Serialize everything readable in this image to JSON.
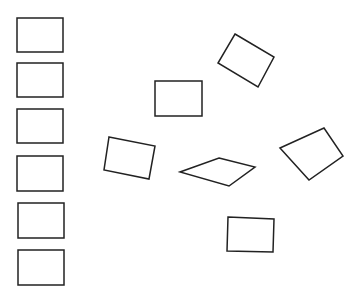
{
  "canvas": {
    "width": 358,
    "height": 299,
    "background": "#ffffff",
    "stroke": "#222222",
    "stroke_width": 1.5
  },
  "shapes": [
    {
      "id": "left-rect-1",
      "points": "17,18 63,18 63,52 17,52"
    },
    {
      "id": "left-rect-2",
      "points": "17,63 63,63 63,97 17,97"
    },
    {
      "id": "left-rect-3",
      "points": "17,109 63,109 63,143 17,143"
    },
    {
      "id": "left-rect-4",
      "points": "17,156 63,156 63,191 17,191"
    },
    {
      "id": "left-rect-5",
      "points": "18,203 64,203 64,238 18,238"
    },
    {
      "id": "left-rect-6",
      "points": "18,250 64,250 64,285 18,285"
    },
    {
      "id": "rect-upright-top",
      "points": "155,81 202,81 202,116 155,116"
    },
    {
      "id": "rect-tilted-top-right",
      "points": "235,34 274,57 258,87 218,63"
    },
    {
      "id": "rect-tilted-left",
      "points": "109,137 155,146 149,179 104,170"
    },
    {
      "id": "parallelogram",
      "points": "219,158 255,167 229,186 180,172"
    },
    {
      "id": "quad-right",
      "points": "280,148 324,128 343,156 309,180"
    },
    {
      "id": "rect-bottom",
      "points": "228,217 274,219 273,252 227,251"
    }
  ]
}
